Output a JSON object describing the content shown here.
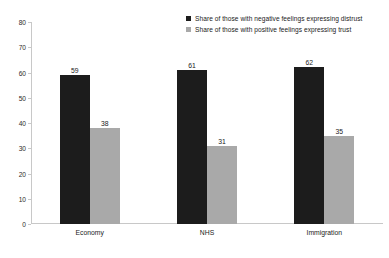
{
  "chart_data": {
    "type": "bar",
    "title": "",
    "subtitle": "",
    "xlabel": "",
    "ylabel": "",
    "categories": [
      "Economy",
      "NHS",
      "Immigration"
    ],
    "series": [
      {
        "name": "Share of those with negative feelings expressing distrust",
        "color": "#1c1c1c",
        "values": [
          59,
          61,
          62
        ]
      },
      {
        "name": "Share of those with positive feelings expressing trust",
        "color": "#a9a9a9",
        "values": [
          38,
          31,
          35
        ]
      }
    ],
    "ylim": [
      0,
      80
    ],
    "yticks": [
      0,
      10,
      20,
      30,
      40,
      50,
      60,
      70,
      80
    ],
    "ytick_labels": [
      "0",
      "10",
      "20",
      "30",
      "40",
      "50",
      "60",
      "70",
      "80"
    ],
    "grid": false,
    "legend_position": "top-right",
    "data_labels": true,
    "axis_color": "#c8c8c8",
    "background": "#ffffff"
  },
  "legend": {
    "entries": [
      {
        "label": "Share of those with negative feelings expressing distrust",
        "color": "#1c1c1c"
      },
      {
        "label": "Share of those with positive feelings expressing trust",
        "color": "#a9a9a9"
      }
    ]
  }
}
